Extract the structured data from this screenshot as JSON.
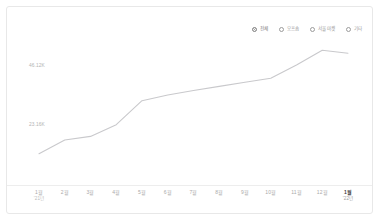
{
  "legend": {
    "items": [
      {
        "label": "전체",
        "active": true,
        "icon": "filled-circle-marker"
      },
      {
        "label": "오프숍",
        "active": false,
        "icon": "circle-marker"
      },
      {
        "label": "서울마켓",
        "active": false,
        "icon": "circle-marker"
      },
      {
        "label": "기타",
        "active": false,
        "icon": "circle-marker"
      }
    ]
  },
  "chart_data": {
    "type": "line",
    "title": "",
    "xlabel": "",
    "ylabel": "",
    "grid": false,
    "legend_position": "top-right",
    "line_color": "#c9c9cc",
    "categories": [
      "1월",
      "2월",
      "3월",
      "4월",
      "5월",
      "6월",
      "7월",
      "8월",
      "9월",
      "10월",
      "11월",
      "12월",
      "1월"
    ],
    "x_sublabels": [
      "'21년",
      "",
      "",
      "",
      "",
      "",
      "",
      "",
      "",
      "",
      "",
      "",
      "'22년"
    ],
    "series": [
      {
        "name": "전체",
        "values": [
          11800,
          17200,
          18600,
          23200,
          32600,
          34800,
          36600,
          38200,
          39800,
          41400,
          46600,
          52400,
          51200
        ]
      }
    ],
    "ytick_labels": [
      "46.12K",
      "23.16K"
    ],
    "ytick_values": [
      46120,
      23160
    ],
    "ylim": [
      7000,
      56000
    ],
    "current_point_index": 12
  }
}
